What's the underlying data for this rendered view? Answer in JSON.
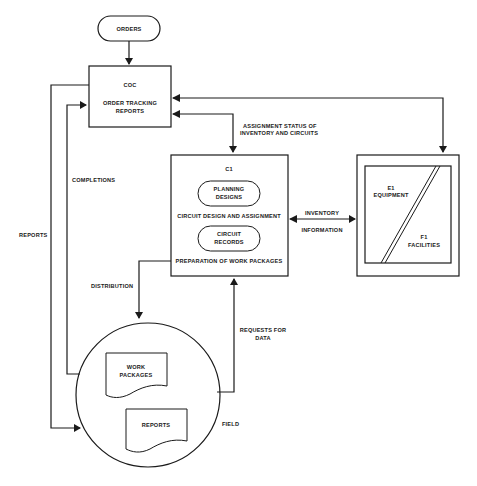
{
  "diagram": {
    "nodes": {
      "orders": {
        "label": "ORDERS"
      },
      "coc": {
        "id": "COC",
        "label_line1": "ORDER TRACKING",
        "label_line2": "REPORTS"
      },
      "c1": {
        "id": "C1",
        "planning_line1": "PLANNING",
        "planning_line2": "DESIGNS",
        "function1": "CIRCUIT DESIGN AND ASSIGNMENT",
        "records_line1": "CIRCUIT",
        "records_line2": "RECORDS",
        "function2": "PREPARATION OF WORK PACKAGES"
      },
      "e1": {
        "id": "E1",
        "label": "EQUIPMENT"
      },
      "f1": {
        "id": "F1",
        "label": "FACILITIES"
      },
      "field": {
        "label": "FIELD",
        "doc1_line1": "WORK",
        "doc1_line2": "PACKAGES",
        "doc2": "REPORTS"
      }
    },
    "edges": {
      "assignment_line1": "ASSIGNMENT STATUS OF",
      "assignment_line2": "INVENTORY AND CIRCUITS",
      "inventory_line1": "INVENTORY",
      "inventory_line2": "INFORMATION",
      "completions": "COMPLETIONS",
      "reports": "REPORTS",
      "distribution": "DISTRIBUTION",
      "requests_line1": "REQUESTS FOR",
      "requests_line2": "DATA"
    }
  }
}
